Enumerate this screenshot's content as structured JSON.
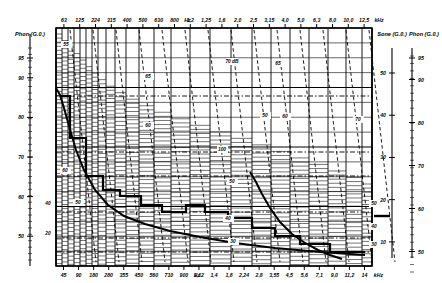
{
  "chart_data": {
    "type": "line",
    "xlabel": "Frequency",
    "ylabel": "Loudness level",
    "grid": true,
    "axes": {
      "top": {
        "unit": "kHz",
        "unit_mid": "Hz",
        "ticks": [
          "63",
          "125",
          "224",
          "315",
          "400",
          "500",
          "630",
          "800",
          "1,2",
          "1,25",
          "1,6",
          "2,0",
          "2,5",
          "3,15",
          "4,0",
          "5,0",
          "6,3",
          "8,0",
          "10,0",
          "12,5"
        ],
        "unit_after_index": 7,
        "unit_tail_index": 19
      },
      "bottom": {
        "unit": "kHz",
        "unit_mid": "Hz",
        "ticks": [
          "45",
          "90",
          "180",
          "280",
          "355",
          "450",
          "560",
          "710",
          "900",
          "1,12",
          "1,4",
          "1,8",
          "2,24",
          "2,8",
          "3,55",
          "4,5",
          "5,6",
          "7,1",
          "9,0",
          "11,2",
          "14"
        ],
        "unit_after_index": 8,
        "unit_tail_index": 20
      },
      "left": {
        "label": "Phon (G.0.)",
        "ticks": [
          "95",
          "90",
          "80",
          "70",
          "60",
          "50"
        ],
        "positions": [
          95,
          90,
          80,
          70,
          60,
          50
        ]
      },
      "right_sone": {
        "label": "Sone (G.0.)",
        "ticks": [
          "50",
          "40",
          "30",
          "20",
          "10"
        ],
        "positions": [
          50,
          40,
          30,
          20,
          10
        ]
      },
      "right_phon": {
        "label": "Phon (G.0.)",
        "ticks": [
          "95",
          "90",
          "80",
          "70",
          "60",
          "50"
        ],
        "positions": [
          95,
          90,
          80,
          70,
          60,
          50
        ]
      }
    },
    "contour_labels": [
      {
        "text": "70 dB",
        "x": 232,
        "y": 63
      },
      {
        "text": "55",
        "x": 66,
        "y": 46
      },
      {
        "text": "65",
        "x": 148,
        "y": 78
      },
      {
        "text": "65",
        "x": 278,
        "y": 65
      },
      {
        "text": "60",
        "x": 65,
        "y": 172
      },
      {
        "text": "60",
        "x": 148,
        "y": 127
      },
      {
        "text": "60",
        "x": 285,
        "y": 118
      },
      {
        "text": "100",
        "x": 222,
        "y": 151
      },
      {
        "text": "70",
        "x": 358,
        "y": 121
      },
      {
        "text": "50",
        "x": 265,
        "y": 117
      },
      {
        "text": "50",
        "x": 232,
        "y": 183
      },
      {
        "text": "50",
        "x": 78,
        "y": 204
      },
      {
        "text": "40",
        "x": 228,
        "y": 220
      },
      {
        "text": "40",
        "x": 48,
        "y": 205
      },
      {
        "text": "30",
        "x": 233,
        "y": 243
      },
      {
        "text": "20",
        "x": 48,
        "y": 235
      },
      {
        "text": "50",
        "x": 374,
        "y": 205
      },
      {
        "text": "40",
        "x": 374,
        "y": 228
      },
      {
        "text": "30",
        "x": 374,
        "y": 246
      }
    ],
    "series": [
      {
        "name": "Measured loudness pattern",
        "style": "bold-staircase",
        "points": [
          [
            60,
            96
          ],
          [
            70,
            96
          ],
          [
            70,
            138
          ],
          [
            86,
            138
          ],
          [
            86,
            176
          ],
          [
            103,
            176
          ],
          [
            103,
            190
          ],
          [
            120,
            190
          ],
          [
            120,
            196
          ],
          [
            141,
            196
          ],
          [
            141,
            205
          ],
          [
            162,
            205
          ],
          [
            162,
            212
          ],
          [
            186,
            212
          ],
          [
            186,
            205
          ],
          [
            205,
            205
          ],
          [
            205,
            212
          ],
          [
            228,
            212
          ],
          [
            228,
            218
          ],
          [
            252,
            218
          ],
          [
            252,
            228
          ],
          [
            275,
            228
          ],
          [
            275,
            236
          ],
          [
            300,
            236
          ],
          [
            300,
            244
          ],
          [
            330,
            244
          ],
          [
            330,
            252
          ],
          [
            365,
            252
          ]
        ]
      },
      {
        "name": "Initial steep decay",
        "style": "bold-curve",
        "points": [
          [
            56,
            88
          ],
          [
            60,
            95
          ],
          [
            64,
            108
          ],
          [
            69,
            126
          ],
          [
            76,
            150
          ],
          [
            84,
            170
          ],
          [
            95,
            190
          ],
          [
            108,
            205
          ],
          [
            124,
            216
          ],
          [
            145,
            224
          ],
          [
            170,
            231
          ],
          [
            200,
            237
          ],
          [
            235,
            243
          ],
          [
            275,
            248
          ],
          [
            320,
            252
          ],
          [
            365,
            255
          ]
        ]
      },
      {
        "name": "Secondary decay",
        "style": "bold-curve",
        "points": [
          [
            250,
            172
          ],
          [
            256,
            182
          ],
          [
            262,
            194
          ],
          [
            270,
            208
          ],
          [
            280,
            222
          ],
          [
            292,
            234
          ],
          [
            305,
            243
          ],
          [
            318,
            250
          ],
          [
            330,
            255
          ],
          [
            342,
            259
          ]
        ]
      }
    ],
    "bark_band_edges_px": [
      56,
      62,
      68,
      74,
      80,
      86,
      92,
      98,
      106,
      115,
      126,
      139,
      154,
      171,
      190,
      210,
      231,
      252,
      271,
      290,
      309,
      328,
      346,
      362,
      372
    ],
    "annotations": [
      {
        "text": "marker-tick",
        "x": 382,
        "y": 216
      }
    ]
  },
  "colors": {
    "ink": "#000000",
    "paper": "#ffffff",
    "grid": "#000000"
  }
}
